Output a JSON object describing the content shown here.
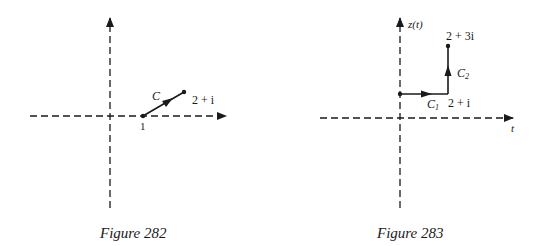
{
  "figures": [
    {
      "caption": "Figure 282",
      "labels": {
        "curve": "C",
        "start": "1",
        "end": "2 + i"
      }
    },
    {
      "caption": "Figure 283",
      "labels": {
        "y_axis": "z(t)",
        "x_axis": "t",
        "c1": "C",
        "c1_sub": "1",
        "c2": "C",
        "c2_sub": "2",
        "corner": "2 + i",
        "end": "2 + 3i"
      }
    }
  ],
  "colors": {
    "ink": "#1a1a1a",
    "background": "#ffffff"
  }
}
